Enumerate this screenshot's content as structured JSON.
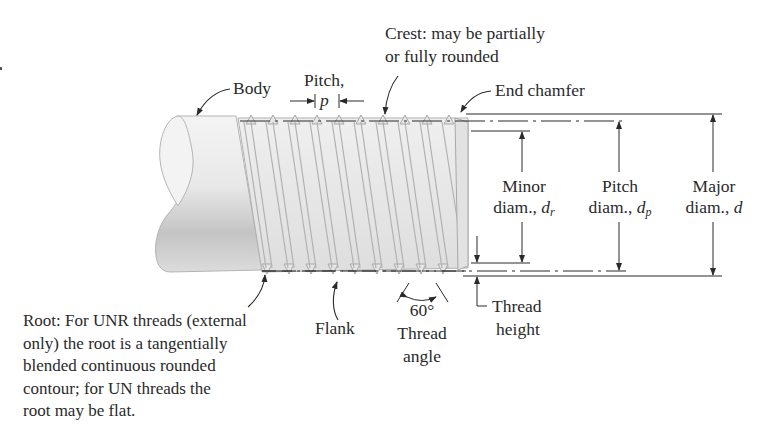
{
  "figure": {
    "labels": {
      "crest": {
        "line1": "Crest: may be partially",
        "line2": "or fully rounded"
      },
      "body": "Body",
      "pitch": {
        "line1": "Pitch,",
        "symbol": "p"
      },
      "end_chamfer": "End chamfer",
      "minor_diam": {
        "line1": "Minor",
        "line2": "diam., ",
        "symbol": "d",
        "subscript": "r"
      },
      "pitch_diam": {
        "line1": "Pitch",
        "line2": "diam., ",
        "symbol": "d",
        "subscript": "p"
      },
      "major_diam": {
        "line1": "Major",
        "line2": "diam., ",
        "symbol": "d"
      },
      "root": {
        "lines": [
          "Root: For UNR threads (external",
          "only) the root is a tangentially",
          "blended continuous rounded",
          "contour; for UN threads the",
          "root may be flat."
        ]
      },
      "flank": "Flank",
      "thread_angle": {
        "value": "60°",
        "line1": "Thread",
        "line2": "angle"
      },
      "thread_height": {
        "line1": "Thread",
        "line2": "height"
      }
    },
    "colors": {
      "ink": "#2a2a2a",
      "thread_fill": "#e4e4e4",
      "thread_edge": "#a8a8a8",
      "body_light": "#f2f2f2",
      "body_dark": "#bdbdbd"
    }
  }
}
